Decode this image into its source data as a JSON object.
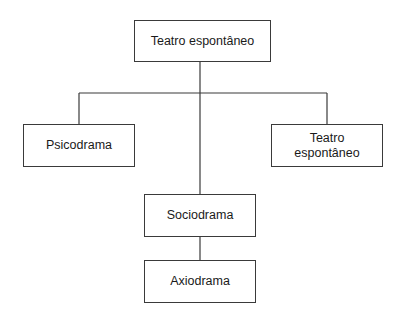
{
  "diagram": {
    "type": "hierarchy",
    "root": {
      "label": "Teatro espontâneo"
    },
    "children": [
      {
        "label": "Psicodrama"
      },
      {
        "label": "Sociodrama",
        "child": {
          "label": "Axiodrama"
        }
      },
      {
        "label_line1": "Teatro",
        "label_line2": "espontâneo"
      }
    ]
  },
  "nodes": {
    "root": "Teatro espontâneo",
    "psicodrama": "Psicodrama",
    "sociodrama": "Sociodrama",
    "axiodrama": "Axiodrama",
    "teatro_right_line1": "Teatro",
    "teatro_right_line2": "espontâneo"
  },
  "colors": {
    "line": "#3a3a3a",
    "background": "#ffffff",
    "text": "#1a1a1a"
  }
}
